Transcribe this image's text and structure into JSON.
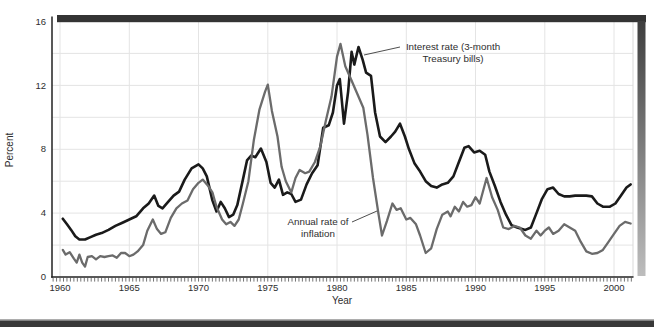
{
  "figure": {
    "y_axis_title": "Percent",
    "x_axis_title": "Year"
  },
  "decorations": {
    "top_bar_color": "#343434",
    "right_shadow_top": "#3e3e3e",
    "right_shadow_bottom": "#bdbdbd",
    "bottom_band_color": "#383838",
    "bottom_band_edge_color": "#9a9a9a",
    "axis_color": "#222222",
    "plot_right_border_color": "#d9d9d9"
  },
  "chart_data": {
    "type": "line",
    "title": "",
    "xlabel": "Year",
    "ylabel": "Percent",
    "xlim": [
      1959.42,
      2001.37
    ],
    "ylim": [
      0,
      16
    ],
    "x_ticks": [
      1960,
      1965,
      1970,
      1975,
      1980,
      1985,
      1990,
      1995,
      2000
    ],
    "y_ticks": [
      0,
      4,
      8,
      12,
      16
    ],
    "x_minor_tick_step": 0.25,
    "grid": {
      "vertical_at": [
        1960,
        1965,
        1970,
        1975,
        1980,
        1985,
        1990,
        1995,
        2000
      ],
      "horizontal_at": [
        2,
        4,
        6,
        8,
        10,
        12,
        14
      ],
      "color": "#e4e4e4"
    },
    "legend_position": "annotations-on-plot",
    "series": [
      {
        "name": "Interest rate (3-month Treasury bills)",
        "color": "#1a1a1a",
        "width": 2.6,
        "points": [
          [
            1960.2,
            3.65
          ],
          [
            1960.5,
            3.3
          ],
          [
            1960.8,
            2.95
          ],
          [
            1961.1,
            2.55
          ],
          [
            1961.4,
            2.35
          ],
          [
            1961.8,
            2.35
          ],
          [
            1962.2,
            2.5
          ],
          [
            1962.6,
            2.65
          ],
          [
            1963.0,
            2.75
          ],
          [
            1963.5,
            2.95
          ],
          [
            1964.0,
            3.2
          ],
          [
            1964.5,
            3.4
          ],
          [
            1965.0,
            3.6
          ],
          [
            1965.5,
            3.8
          ],
          [
            1966.0,
            4.3
          ],
          [
            1966.4,
            4.6
          ],
          [
            1966.8,
            5.1
          ],
          [
            1967.1,
            4.45
          ],
          [
            1967.4,
            4.3
          ],
          [
            1967.8,
            4.7
          ],
          [
            1968.2,
            5.1
          ],
          [
            1968.6,
            5.35
          ],
          [
            1969.0,
            6.1
          ],
          [
            1969.5,
            6.8
          ],
          [
            1970.0,
            7.05
          ],
          [
            1970.3,
            6.8
          ],
          [
            1970.6,
            6.3
          ],
          [
            1971.0,
            4.8
          ],
          [
            1971.3,
            4.1
          ],
          [
            1971.6,
            4.7
          ],
          [
            1971.9,
            4.3
          ],
          [
            1972.2,
            3.75
          ],
          [
            1972.5,
            3.9
          ],
          [
            1972.8,
            4.5
          ],
          [
            1973.2,
            6.1
          ],
          [
            1973.5,
            7.3
          ],
          [
            1973.8,
            7.6
          ],
          [
            1974.1,
            7.5
          ],
          [
            1974.5,
            8.05
          ],
          [
            1974.9,
            7.2
          ],
          [
            1975.2,
            5.9
          ],
          [
            1975.5,
            5.6
          ],
          [
            1975.8,
            6.1
          ],
          [
            1976.1,
            5.15
          ],
          [
            1976.4,
            5.3
          ],
          [
            1976.7,
            5.2
          ],
          [
            1977.0,
            4.7
          ],
          [
            1977.4,
            4.85
          ],
          [
            1977.8,
            5.8
          ],
          [
            1978.2,
            6.5
          ],
          [
            1978.6,
            7.0
          ],
          [
            1979.0,
            9.35
          ],
          [
            1979.4,
            9.5
          ],
          [
            1979.7,
            10.3
          ],
          [
            1980.0,
            12.0
          ],
          [
            1980.2,
            12.4
          ],
          [
            1980.5,
            9.6
          ],
          [
            1980.8,
            11.6
          ],
          [
            1981.05,
            14.1
          ],
          [
            1981.25,
            13.3
          ],
          [
            1981.55,
            14.4
          ],
          [
            1981.85,
            13.6
          ],
          [
            1982.1,
            12.8
          ],
          [
            1982.45,
            12.6
          ],
          [
            1982.75,
            10.3
          ],
          [
            1983.1,
            8.8
          ],
          [
            1983.5,
            8.45
          ],
          [
            1983.9,
            8.8
          ],
          [
            1984.2,
            9.1
          ],
          [
            1984.55,
            9.6
          ],
          [
            1984.9,
            8.8
          ],
          [
            1985.2,
            8.0
          ],
          [
            1985.6,
            7.1
          ],
          [
            1986.0,
            6.6
          ],
          [
            1986.4,
            6.0
          ],
          [
            1986.8,
            5.7
          ],
          [
            1987.2,
            5.6
          ],
          [
            1987.6,
            5.8
          ],
          [
            1988.0,
            5.9
          ],
          [
            1988.4,
            6.3
          ],
          [
            1988.8,
            7.2
          ],
          [
            1989.2,
            8.1
          ],
          [
            1989.5,
            8.2
          ],
          [
            1989.9,
            7.8
          ],
          [
            1990.3,
            7.9
          ],
          [
            1990.7,
            7.65
          ],
          [
            1991.0,
            6.6
          ],
          [
            1991.4,
            5.7
          ],
          [
            1991.8,
            4.7
          ],
          [
            1992.2,
            3.9
          ],
          [
            1992.6,
            3.25
          ],
          [
            1993.0,
            3.1
          ],
          [
            1993.6,
            2.95
          ],
          [
            1994.0,
            3.1
          ],
          [
            1994.4,
            4.0
          ],
          [
            1994.8,
            4.9
          ],
          [
            1995.2,
            5.5
          ],
          [
            1995.6,
            5.6
          ],
          [
            1996.0,
            5.2
          ],
          [
            1996.4,
            5.05
          ],
          [
            1996.8,
            5.05
          ],
          [
            1997.2,
            5.1
          ],
          [
            1997.6,
            5.1
          ],
          [
            1998.0,
            5.1
          ],
          [
            1998.4,
            5.05
          ],
          [
            1998.8,
            4.6
          ],
          [
            1999.2,
            4.4
          ],
          [
            1999.7,
            4.4
          ],
          [
            2000.1,
            4.6
          ],
          [
            2000.5,
            5.1
          ],
          [
            2000.9,
            5.6
          ],
          [
            2001.2,
            5.8
          ]
        ]
      },
      {
        "name": "Annual rate of inflation",
        "color": "#6b6b6b",
        "width": 2.3,
        "points": [
          [
            1960.2,
            1.7
          ],
          [
            1960.4,
            1.4
          ],
          [
            1960.7,
            1.55
          ],
          [
            1961.0,
            1.15
          ],
          [
            1961.2,
            0.9
          ],
          [
            1961.4,
            1.4
          ],
          [
            1961.6,
            0.9
          ],
          [
            1961.8,
            0.65
          ],
          [
            1962.0,
            1.25
          ],
          [
            1962.3,
            1.3
          ],
          [
            1962.6,
            1.1
          ],
          [
            1962.9,
            1.3
          ],
          [
            1963.2,
            1.25
          ],
          [
            1963.5,
            1.3
          ],
          [
            1963.8,
            1.35
          ],
          [
            1964.1,
            1.2
          ],
          [
            1964.4,
            1.5
          ],
          [
            1964.7,
            1.5
          ],
          [
            1965.0,
            1.3
          ],
          [
            1965.3,
            1.4
          ],
          [
            1965.6,
            1.6
          ],
          [
            1966.0,
            2.0
          ],
          [
            1966.3,
            2.9
          ],
          [
            1966.7,
            3.6
          ],
          [
            1967.0,
            3.0
          ],
          [
            1967.3,
            2.7
          ],
          [
            1967.6,
            2.8
          ],
          [
            1968.0,
            3.7
          ],
          [
            1968.4,
            4.3
          ],
          [
            1968.8,
            4.6
          ],
          [
            1969.2,
            4.8
          ],
          [
            1969.6,
            5.5
          ],
          [
            1970.0,
            5.9
          ],
          [
            1970.3,
            6.1
          ],
          [
            1970.7,
            5.7
          ],
          [
            1971.0,
            5.3
          ],
          [
            1971.3,
            4.4
          ],
          [
            1971.7,
            3.6
          ],
          [
            1972.0,
            3.3
          ],
          [
            1972.3,
            3.45
          ],
          [
            1972.6,
            3.2
          ],
          [
            1972.9,
            3.6
          ],
          [
            1973.2,
            4.6
          ],
          [
            1973.6,
            6.0
          ],
          [
            1974.0,
            8.6
          ],
          [
            1974.4,
            10.5
          ],
          [
            1974.8,
            11.6
          ],
          [
            1975.0,
            12.05
          ],
          [
            1975.3,
            10.4
          ],
          [
            1975.7,
            8.8
          ],
          [
            1976.0,
            6.9
          ],
          [
            1976.3,
            6.0
          ],
          [
            1976.7,
            5.3
          ],
          [
            1977.0,
            6.2
          ],
          [
            1977.3,
            6.7
          ],
          [
            1977.7,
            6.5
          ],
          [
            1978.0,
            6.6
          ],
          [
            1978.4,
            7.2
          ],
          [
            1978.8,
            8.2
          ],
          [
            1979.2,
            9.8
          ],
          [
            1979.6,
            11.3
          ],
          [
            1980.0,
            13.8
          ],
          [
            1980.25,
            14.6
          ],
          [
            1980.6,
            13.2
          ],
          [
            1981.0,
            12.4
          ],
          [
            1981.4,
            11.6
          ],
          [
            1981.9,
            10.6
          ],
          [
            1982.2,
            8.9
          ],
          [
            1982.6,
            6.2
          ],
          [
            1983.0,
            3.9
          ],
          [
            1983.25,
            2.6
          ],
          [
            1983.6,
            3.5
          ],
          [
            1984.0,
            4.6
          ],
          [
            1984.3,
            4.2
          ],
          [
            1984.6,
            4.3
          ],
          [
            1985.0,
            3.6
          ],
          [
            1985.3,
            3.7
          ],
          [
            1985.7,
            3.3
          ],
          [
            1986.0,
            2.6
          ],
          [
            1986.4,
            1.5
          ],
          [
            1986.8,
            1.8
          ],
          [
            1987.2,
            3.0
          ],
          [
            1987.6,
            3.9
          ],
          [
            1988.0,
            4.1
          ],
          [
            1988.2,
            3.8
          ],
          [
            1988.5,
            4.4
          ],
          [
            1988.8,
            4.1
          ],
          [
            1989.1,
            4.7
          ],
          [
            1989.4,
            4.4
          ],
          [
            1989.7,
            4.5
          ],
          [
            1990.0,
            5.0
          ],
          [
            1990.3,
            4.6
          ],
          [
            1990.8,
            6.2
          ],
          [
            1991.2,
            5.0
          ],
          [
            1991.6,
            4.2
          ],
          [
            1992.0,
            3.1
          ],
          [
            1992.4,
            3.0
          ],
          [
            1992.8,
            3.2
          ],
          [
            1993.2,
            3.1
          ],
          [
            1993.6,
            2.6
          ],
          [
            1994.0,
            2.4
          ],
          [
            1994.4,
            2.9
          ],
          [
            1994.7,
            2.6
          ],
          [
            1995.0,
            2.9
          ],
          [
            1995.3,
            3.1
          ],
          [
            1995.6,
            2.7
          ],
          [
            1996.0,
            2.9
          ],
          [
            1996.4,
            3.3
          ],
          [
            1996.8,
            3.1
          ],
          [
            1997.2,
            2.9
          ],
          [
            1997.6,
            2.2
          ],
          [
            1998.0,
            1.6
          ],
          [
            1998.4,
            1.45
          ],
          [
            1998.8,
            1.5
          ],
          [
            1999.2,
            1.7
          ],
          [
            1999.6,
            2.2
          ],
          [
            2000.0,
            2.7
          ],
          [
            2000.4,
            3.2
          ],
          [
            2000.8,
            3.45
          ],
          [
            2001.2,
            3.35
          ]
        ]
      }
    ],
    "annotations": [
      {
        "id": "interest-rate-label",
        "lines": [
          "Interest rate (3-month",
          "Treasury bills)"
        ],
        "text_center_x": 453,
        "line1_y": 50,
        "line2_y": 62,
        "leader": {
          "x1": 364,
          "y1": 55,
          "x2": 400,
          "y2": 47
        }
      },
      {
        "id": "inflation-label",
        "lines": [
          "Annual rate of",
          "inflation"
        ],
        "text_center_x": 318,
        "line1_y": 225,
        "line2_y": 237,
        "leader": {
          "x1": 352,
          "y1": 222,
          "x2": 377,
          "y2": 211
        }
      }
    ]
  }
}
